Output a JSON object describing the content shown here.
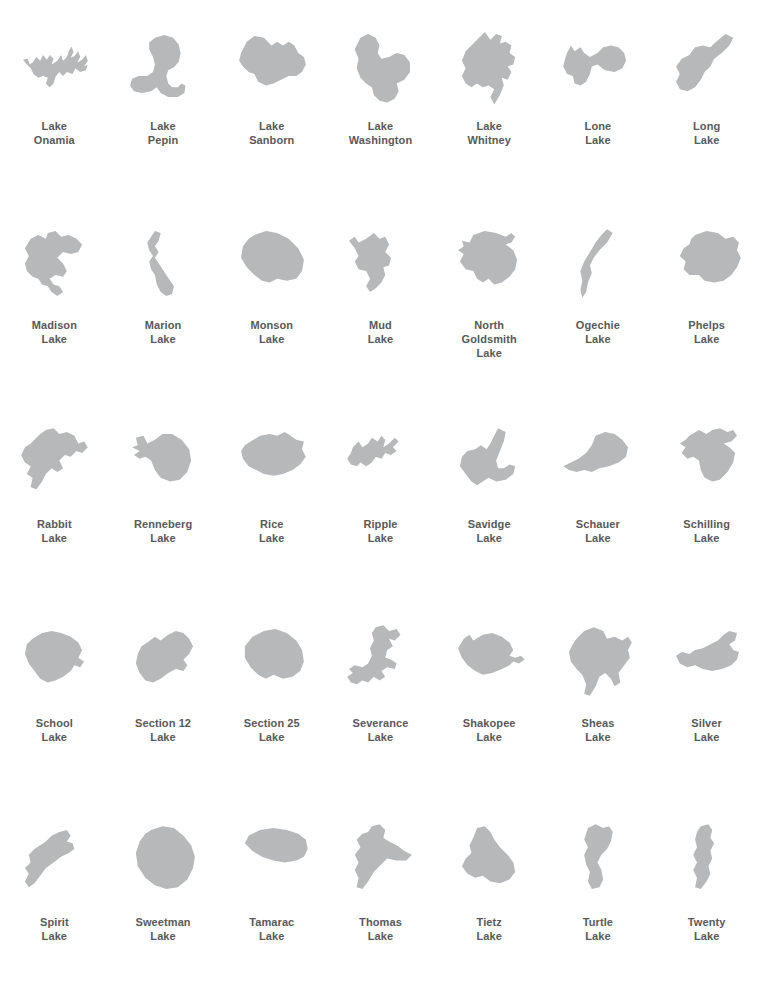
{
  "plate": {
    "title": "Lake Outlines Reference Plate",
    "background_color": "#ffffff",
    "shape_fill_color": "#b7b8ba",
    "caption_color": "#58595b",
    "columns": 7,
    "rows": 5,
    "item_count": 35
  },
  "lakes": [
    {
      "id": "lake-onamia",
      "caption": "Lake\nOnamia",
      "name_line1": "Lake",
      "name_line2": "Onamia",
      "row": 1,
      "column": 1,
      "outline": "30,48 34,42 38,46 41,40 45,45 48,40 52,44 50,50 56,46 60,40 62,46 66,42 68,36 71,31 73,37 70,43 74,41 78,36 80,42 77,48 82,45 86,40 88,46 84,52 88,50 86,56 80,58 75,54 72,60 66,58 62,62 58,58 54,63 52,70 48,74 44,70 46,64 41,62 36,64 31,60 28,54 24,50 20,45 25,44 27,50"
    },
    {
      "id": "lake-pepin",
      "caption": "Lake\nPepin",
      "name_line1": "Lake",
      "name_line2": "Pepin",
      "row": 1,
      "column": 2,
      "outline": "44,22 54,19 63,22 69,29 71,38 69,47 64,53 58,56 56,62 58,70 62,74 68,74 72,70 76,72 75,80 68,84 58,84 50,80 46,74 40,78 30,80 22,78 18,72 20,65 27,62 36,62 42,58 44,50 42,42 38,34 38,27"
    },
    {
      "id": "lake-sanborn",
      "caption": "Lake\nSanborn",
      "name_line1": "Lake",
      "name_line2": "Sanborn",
      "row": 1,
      "column": 3,
      "outline": "20,38 26,26 34,20 44,22 52,30 58,26 64,30 70,26 76,30 80,38 86,42 88,50 84,58 78,62 70,62 62,66 54,70 46,72 38,68 34,60 28,58 22,52 18,46"
    },
    {
      "id": "lake-washington",
      "caption": "Lake\nWashington",
      "name_line1": "Lake",
      "name_line2": "Washington",
      "row": 1,
      "column": 4,
      "outline": "32,22 40,18 48,22 52,30 50,38 54,44 62,42 70,38 78,40 84,48 84,58 78,66 70,70 72,78 68,86 60,90 52,88 46,82 44,74 38,70 32,64 28,54 30,44 26,34"
    },
    {
      "id": "lake-whitney",
      "caption": "Lake\nWhitney",
      "name_line1": "Lake",
      "name_line2": "Whitney",
      "row": 1,
      "column": 5,
      "outline": "40,24 48,16 54,24 60,18 66,20 64,28 70,26 76,30 74,38 80,42 78,50 72,52 76,58 72,66 66,64 68,72 64,82 58,92 54,84 58,76 52,72 46,74 40,70 34,74 28,70 24,62 28,54 24,46 28,36 34,30"
    },
    {
      "id": "lone-lake",
      "caption": "Lone\nLake",
      "name_line1": "Lone",
      "name_line2": "Lake",
      "row": 1,
      "column": 6,
      "outline": "20,38 24,30 28,36 34,32 38,38 44,42 52,38 58,32 66,30 74,32 80,38 82,46 78,54 70,58 60,56 52,50 46,52 44,60 40,68 34,72 28,70 26,62 20,60 16,52 18,44"
    },
    {
      "id": "long-lake",
      "caption": "Long\nLake",
      "name_line1": "Long",
      "name_line2": "Lake",
      "row": 1,
      "column": 7,
      "outline": "72,18 80,22 76,30 68,38 60,44 56,52 50,58 46,66 40,74 32,78 24,76 20,68 24,60 20,52 26,44 34,40 40,32 48,30 56,32 62,26"
    },
    {
      "id": "madison-lake",
      "caption": "Madison\nLake",
      "name_line1": "Madison",
      "name_line2": "Lake",
      "row": 2,
      "column": 1,
      "outline": "28,24 36,20 44,24 46,18 54,16 60,22 68,20 76,24 82,30 78,38 70,40 62,38 56,44 62,50 66,58 62,64 54,62 48,66 52,72 58,74 62,80 56,84 50,80 46,74 40,72 36,66 30,64 24,58 22,50 26,42 22,34"
    },
    {
      "id": "marion-lake",
      "caption": "Marion\nLake",
      "name_line1": "Marion",
      "name_line2": "Lake",
      "row": 2,
      "column": 2,
      "outline": "44,16 50,18 48,26 44,32 48,38 44,44 48,50 52,56 56,62 60,68 64,74 62,82 56,84 50,80 46,72 44,62 40,56 38,48 42,42 38,36 36,28 40,22"
    },
    {
      "id": "monson-lake",
      "caption": "Monson\nLake",
      "name_line1": "Monson",
      "name_line2": "Lake",
      "row": 2,
      "column": 3,
      "outline": "34,20 46,16 58,18 70,24 80,34 86,46 84,58 78,66 68,68 58,66 50,70 42,68 34,62 26,54 20,44 22,32 28,24"
    },
    {
      "id": "mud-lake",
      "caption": "Mud\nLake",
      "name_line1": "Mud",
      "name_line2": "Lake",
      "row": 2,
      "column": 4,
      "outline": "20,26 26,22 30,28 38,24 46,18 52,24 58,22 62,30 58,38 64,44 62,52 56,54 58,62 54,70 48,76 42,80 38,74 42,66 38,58 30,56 26,48 30,42 26,34"
    },
    {
      "id": "north-goldsmith-lake",
      "caption": "North\nGoldsmith\nLake",
      "name_line1": "North",
      "name_line2": "Goldsmith",
      "name_line3": "Lake",
      "row": 2,
      "column": 5,
      "outline": "36,20 48,16 60,18 70,22 76,18 80,22 76,28 70,30 78,36 82,46 80,56 74,64 66,70 58,72 52,66 46,70 40,66 36,58 28,56 22,48 26,40 20,36 26,32 24,26 32,28"
    },
    {
      "id": "ogechie-lake",
      "caption": "Ogechie\nLake",
      "name_line1": "Ogechie",
      "name_line2": "Lake",
      "row": 2,
      "column": 6,
      "outline": "62,14 68,18 62,28 54,36 48,44 44,52 46,60 42,70 40,80 36,86 34,78 36,68 34,58 38,48 44,38 50,28 56,20"
    },
    {
      "id": "phelps-lake",
      "caption": "Phelps\nLake",
      "name_line1": "Phelps",
      "name_line2": "Lake",
      "row": 2,
      "column": 7,
      "outline": "40,20 52,16 64,18 72,24 80,22 86,28 84,36 88,44 84,54 78,62 70,68 60,70 50,68 44,62 34,62 28,56 30,48 24,42 28,34 34,30 36,24"
    },
    {
      "id": "rabbit-lake",
      "caption": "Rabbit\nLake",
      "name_line1": "Rabbit",
      "name_line2": "Lake",
      "row": 3,
      "column": 1,
      "outline": "44,16 52,14 58,20 66,18 74,22 78,30 84,28 88,34 82,40 76,38 70,44 64,42 58,48 62,56 56,60 50,56 44,62 40,70 34,78 28,76 30,66 24,62 28,54 22,50 18,42 22,34 28,30 34,24 38,20"
    },
    {
      "id": "renneberg-lake",
      "caption": "Renneberg\nLake",
      "name_line1": "Renneberg",
      "name_line2": "Lake",
      "row": 3,
      "column": 2,
      "outline": "24,24 32,22 36,30 44,26 52,20 62,20 72,26 80,36 82,48 78,60 70,68 60,70 50,66 44,58 40,48 34,44 28,46 22,42 28,38 20,34 26,32"
    },
    {
      "id": "rice-lake",
      "caption": "Rice\nLake",
      "name_line1": "Rice",
      "name_line2": "Lake",
      "row": 3,
      "column": 3,
      "outline": "30,28 40,22 50,20 58,22 66,18 72,22 78,26 86,28 84,36 88,44 82,52 74,58 64,62 54,64 44,62 36,58 28,54 22,46 20,38 24,32"
    },
    {
      "id": "ripple-lake",
      "caption": "Ripple\nLake",
      "name_line1": "Ripple",
      "name_line2": "Lake",
      "row": 3,
      "column": 4,
      "outline": "24,34 30,28 34,34 40,30 44,24 50,28 54,22 58,26 56,34 62,30 68,24 72,28 66,34 70,38 64,42 58,40 54,46 48,44 44,50 38,54 32,50 28,54 22,52 18,46 22,40"
    },
    {
      "id": "savidge-lake",
      "caption": "Savidge\nLake",
      "name_line1": "Savidge",
      "name_line2": "Lake",
      "row": 3,
      "column": 5,
      "outline": "62,14 70,18 68,28 64,38 60,48 62,56 68,56 74,52 80,54 78,62 70,68 60,70 52,66 46,70 40,74 34,70 28,62 22,54 24,44 30,38 38,36 44,32 50,36 54,30 58,22"
    },
    {
      "id": "schauer-lake",
      "caption": "Schauer\nLake",
      "name_line1": "Schauer",
      "name_line2": "Lake",
      "row": 3,
      "column": 6,
      "outline": "50,22 60,18 70,20 78,26 84,34 82,44 74,50 64,54 54,56 46,60 38,58 30,60 22,58 16,54 24,50 32,46 40,40 46,32"
    },
    {
      "id": "schilling-lake",
      "caption": "Schilling\nLake",
      "name_line1": "Schilling",
      "name_line2": "Lake",
      "row": 3,
      "column": 7,
      "outline": "34,22 44,16 52,20 58,16 66,14 74,18 80,16 84,22 78,28 70,30 76,34 82,40 80,50 74,60 66,68 58,70 50,66 46,58 44,48 38,44 32,46 26,40 30,34 24,30 30,26"
    },
    {
      "id": "school-lake",
      "caption": "School\nLake",
      "name_line1": "School",
      "name_line2": "Lake",
      "row": 4,
      "column": 1,
      "outline": "30,26 40,20 50,18 60,20 70,24 78,30 82,38 78,46 84,50 80,56 74,54 70,60 62,66 54,70 46,72 38,68 32,60 26,52 22,42 24,32"
    },
    {
      "id": "section-12-lake",
      "caption": "Section 12\nLake",
      "name_line1": "Section 12",
      "name_line2": "Lake",
      "row": 4,
      "column": 2,
      "outline": "36,30 44,24 50,28 58,22 66,18 74,20 80,26 84,34 80,42 74,48 78,54 74,60 66,58 58,62 50,68 42,72 34,70 28,62 24,52 26,42 30,34"
    },
    {
      "id": "section-25-lake",
      "caption": "Section 25\nLake",
      "name_line1": "Section 25",
      "name_line2": "Lake",
      "row": 4,
      "column": 3,
      "outline": "32,24 44,18 56,16 68,20 78,28 84,38 86,50 82,60 74,66 64,68 54,64 46,68 38,64 30,56 24,46 24,34"
    },
    {
      "id": "severance-lake",
      "caption": "Severance\nLake",
      "name_line1": "Severance",
      "name_line2": "Lake",
      "row": 4,
      "column": 4,
      "outline": "48,14 56,12 62,18 70,16 74,22 68,28 62,26 66,34 60,38 58,46 64,48 70,52 68,58 60,56 54,60 58,66 52,70 46,66 40,72 34,70 28,74 22,72 18,66 24,62 20,58 26,54 34,56 40,52 44,44 42,36 46,28 44,20"
    },
    {
      "id": "shakopee-lake",
      "caption": "Shakopee\nLake",
      "name_line1": "Shakopee",
      "name_line2": "Lake",
      "row": 4,
      "column": 5,
      "outline": "26,26 32,22 36,28 46,22 56,20 66,24 74,30 78,38 74,44 80,46 86,44 90,48 84,52 78,50 74,54 66,58 56,62 46,64 38,60 30,54 24,46 20,36"
    },
    {
      "id": "sheas-lake",
      "caption": "Sheas\nLake",
      "name_line1": "Sheas",
      "name_line2": "Lake",
      "row": 4,
      "column": 6,
      "outline": "30,26 38,18 48,14 58,18 62,26 70,24 78,28 84,24 88,30 84,38 86,46 80,54 74,62 76,72 70,76 66,68 60,62 54,66 50,76 44,86 38,84 40,74 36,64 30,58 24,50 22,40 26,32"
    },
    {
      "id": "silver-lake",
      "caption": "Silver\nLake",
      "name_line1": "Silver",
      "name_line2": "Lake",
      "row": 4,
      "column": 7,
      "outline": "76,18 84,20 82,28 76,32 80,38 86,40 84,48 78,54 68,58 58,60 48,58 40,54 32,56 24,52 20,44 26,40 34,42 40,38 48,36 56,32 64,28 70,22"
    },
    {
      "id": "spirit-lake",
      "caption": "Spirit\nLake",
      "name_line1": "Spirit",
      "name_line2": "Lake",
      "row": 5,
      "column": 1,
      "outline": "58,20 66,18 70,24 66,30 72,32 74,38 68,42 60,46 52,52 44,58 38,66 32,74 26,78 22,72 26,64 22,58 28,52 26,44 32,38 38,34 44,30 50,24"
    },
    {
      "id": "sweetman-lake",
      "caption": "Sweetman\nLake",
      "name_line1": "Sweetman",
      "name_line2": "Lake",
      "row": 5,
      "column": 2,
      "outline": "40,18 52,14 64,16 74,24 82,34 86,46 84,58 78,70 68,78 56,80 44,76 34,68 26,56 24,42 28,30 34,22"
    },
    {
      "id": "tamarac-lake",
      "caption": "Tamarac\nLake",
      "name_line1": "Tamarac",
      "name_line2": "Lake",
      "row": 5,
      "column": 3,
      "outline": "28,24 40,18 54,16 68,18 80,22 88,28 90,38 86,46 78,50 66,52 54,50 42,46 32,40 24,32"
    },
    {
      "id": "thomas-lake",
      "caption": "Thomas\nLake",
      "name_line1": "Thomas",
      "name_line2": "Lake",
      "row": 5,
      "column": 4,
      "outline": "44,14 52,12 58,18 56,26 62,30 70,34 78,40 86,44 80,50 70,50 60,48 54,54 46,62 40,72 34,80 28,78 30,68 26,60 30,52 26,44 32,36 28,28 34,22 40,20"
    },
    {
      "id": "tietz-lake",
      "caption": "Tietz\nLake",
      "name_line1": "Tietz",
      "name_line2": "Lake",
      "row": 5,
      "column": 5,
      "outline": "40,16 48,14 54,20 58,28 64,36 72,44 78,52 80,62 74,70 64,74 54,72 46,66 38,68 30,64 24,56 28,48 34,42 32,34 36,26"
    },
    {
      "id": "turtle-lake",
      "caption": "Turtle\nLake",
      "name_line1": "Turtle",
      "name_line2": "Lake",
      "row": 5,
      "column": 6,
      "outline": "42,16 50,12 58,16 64,14 68,20 66,30 62,38 56,44 52,52 56,60 58,70 54,78 46,80 42,72 44,62 40,54 38,44 42,36 38,28 40,22"
    },
    {
      "id": "twenty-lake",
      "caption": "Twenty\nLake",
      "name_line1": "Twenty",
      "name_line2": "Lake",
      "row": 5,
      "column": 7,
      "outline": "46,14 54,12 58,18 56,26 60,32 56,40 58,48 54,56 56,64 52,72 46,80 40,78 42,68 38,60 42,52 38,44 42,36 40,28 42,20"
    }
  ]
}
